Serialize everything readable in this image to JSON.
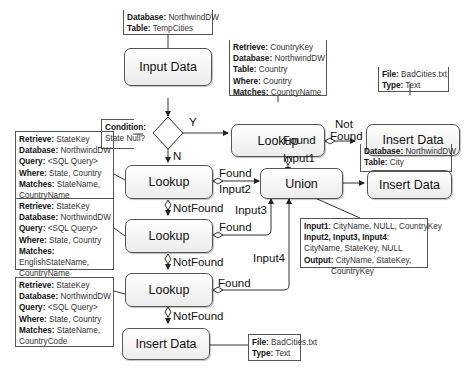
{
  "nodes": {
    "input_data": "Input Data",
    "lookup_country": "Lookup",
    "insert_bad_1": "Insert Data",
    "lookup_1": "Lookup",
    "union": "Union",
    "insert_city": "Insert Data",
    "lookup_2": "Lookup",
    "lookup_3": "Lookup",
    "insert_bad_2": "Insert Data"
  },
  "notes": {
    "input": {
      "database_key": "Database:",
      "database_val": " NorthwindDW",
      "table_key": "Table:",
      "table_val": " TempCities"
    },
    "condition": {
      "key": "Condition:",
      "val": "State Null?"
    },
    "lookup_country": {
      "retrieve_key": "Retrieve:",
      "retrieve_val": " CountryKey",
      "database_key": "Database:",
      "database_val": " NorthwindDW",
      "table_key": "Table:",
      "table_val": " Country",
      "where_key": "Where:",
      "where_val": " Country",
      "matches_key": "Matches:",
      "matches_val": " CountryName"
    },
    "insert_bad_1": {
      "file_key": "File:",
      "file_val": " BadCities.txt",
      "type_key": "Type:",
      "type_val": " Text"
    },
    "insert_city": {
      "database_key": "Database:",
      "database_val": " NorthwindDW",
      "table_key": "Table:",
      "table_val": " City"
    },
    "lookup_1": {
      "retrieve_key": "Retrieve:",
      "retrieve_val": " StateKey",
      "database_key": "Database:",
      "database_val": " NorthwindDW",
      "query_key": "Query:",
      "query_val": " <SQL Query>",
      "where_key": "Where:",
      "where_val": " State, Country",
      "matches_key": "Matches:",
      "matches_val": " StateName,",
      "matches_val2": "CountryName"
    },
    "lookup_2": {
      "retrieve_key": "Retrieve:",
      "retrieve_val": " StateKey",
      "database_key": "Database:",
      "database_val": " NorthwindDW",
      "query_key": "Query:",
      "query_val": " <SQL Query>",
      "where_key": "Where:",
      "where_val": " State, Country",
      "matches_key": "Matches:",
      "matches_val": "EnglishStateName,",
      "matches_val2": "CountryName"
    },
    "lookup_3": {
      "retrieve_key": "Retrieve:",
      "retrieve_val": " StateKey",
      "database_key": "Database:",
      "database_val": " NorthwindDW",
      "query_key": "Query:",
      "query_val": " <SQL Query>",
      "where_key": "Where:",
      "where_val": " State, Country",
      "matches_key": "Matches:",
      "matches_val": " StateName,",
      "matches_val2": "CountryCode"
    },
    "union": {
      "input1_key": "Input1",
      "input1_val": ": CityName, NULL, CountryKey",
      "input234_key": "Input2, Input3, Input4",
      "input234_val": ":",
      "input234_val2": "CityName, StateKey, NULL",
      "output_key": "Output:",
      "output_val": " CityName, StateKey,",
      "output_val2": "CountryKey"
    },
    "insert_bad_2": {
      "file_key": "File:",
      "file_val": " BadCities.txt",
      "type_key": "Type:",
      "type_val": " Text"
    }
  },
  "edge_labels": {
    "y": "Y",
    "n": "N",
    "not_found_1": "Not",
    "not_found_2": "Found",
    "found_country": "Found",
    "input1": "Input1",
    "found_1": "Found",
    "input2": "Input2",
    "notfound_1": "NotFound",
    "input3": "Input3",
    "found_2": "Found",
    "notfound_2": "NotFound",
    "input4": "Input4",
    "found_3": "Found"
  }
}
